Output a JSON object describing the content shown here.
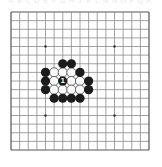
{
  "figure": {
    "kind": "go-board-diagram",
    "title": "",
    "background_color": "#ffffff"
  },
  "coordinate_strip": {
    "visible": true,
    "color": "#e9e9e9",
    "labels": [
      "A",
      "B",
      "C",
      "D",
      "E",
      "F",
      "G",
      "H",
      "J",
      "K",
      "L",
      "M",
      "N",
      "O",
      "P",
      "Q",
      "R"
    ]
  },
  "board": {
    "columns": 17,
    "rows": 17,
    "origin_x": 11,
    "origin_y": 12,
    "spacing": 8.625,
    "line_color": "#8a8a8a",
    "line_width": 0.8,
    "edge_color": "#555555",
    "edge_width": 1.2,
    "star_point_color": "#333333",
    "star_point_radius": 1.3,
    "star_points": [
      {
        "col": 4,
        "row": 4
      },
      {
        "col": 12,
        "row": 4
      },
      {
        "col": 4,
        "row": 12
      },
      {
        "col": 12,
        "row": 12
      }
    ]
  },
  "stones": {
    "black_color": "#1c1c1c",
    "white_color": "#fbfbfb",
    "white_outline_color": "#555555",
    "radius": 4.6,
    "black": [
      {
        "col": 6,
        "row": 6
      },
      {
        "col": 7,
        "row": 6
      },
      {
        "col": 4,
        "row": 7
      },
      {
        "col": 8,
        "row": 7
      },
      {
        "col": 4,
        "row": 8
      },
      {
        "col": 6,
        "row": 8,
        "label": "1"
      },
      {
        "col": 9,
        "row": 8
      },
      {
        "col": 4,
        "row": 9
      },
      {
        "col": 9,
        "row": 9
      },
      {
        "col": 5,
        "row": 10
      },
      {
        "col": 6,
        "row": 10
      },
      {
        "col": 7,
        "row": 10
      },
      {
        "col": 8,
        "row": 10
      }
    ],
    "white": [
      {
        "col": 5,
        "row": 7
      },
      {
        "col": 6,
        "row": 7
      },
      {
        "col": 7,
        "row": 7
      },
      {
        "col": 5,
        "row": 8
      },
      {
        "col": 7,
        "row": 8
      },
      {
        "col": 8,
        "row": 8
      },
      {
        "col": 5,
        "row": 9
      },
      {
        "col": 6,
        "row": 9
      },
      {
        "col": 7,
        "row": 9
      },
      {
        "col": 8,
        "row": 9
      }
    ]
  },
  "move_markers": [
    {
      "label": "1",
      "col": 6,
      "row": 8,
      "stone_color": "black",
      "text_color": "#ffffff"
    }
  ]
}
